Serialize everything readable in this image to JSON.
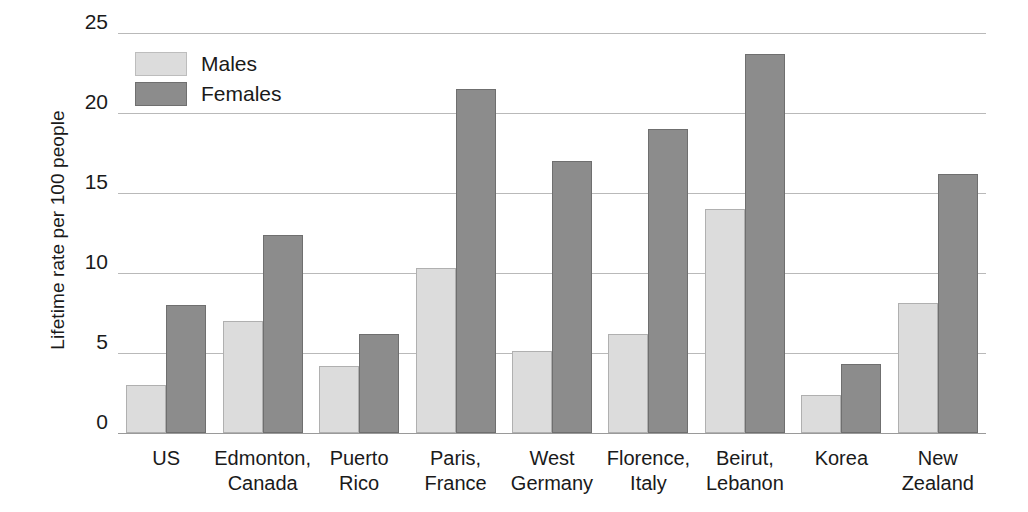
{
  "chart_data": {
    "type": "bar",
    "title": "",
    "subtitle": "",
    "xlabel": "",
    "ylabel": "Lifetime rate per 100 people",
    "ylim": [
      0,
      25
    ],
    "yticks": [
      0,
      5,
      10,
      15,
      20,
      25
    ],
    "ytick_labels": [
      "0",
      "5",
      "10",
      "15",
      "20",
      "25"
    ],
    "grid": true,
    "legend_position": "top-left inside plot",
    "categories": [
      "US",
      "Edmonton,\nCanada",
      "Puerto\nRico",
      "Paris,\nFrance",
      "West\nGermany",
      "Florence,\nItaly",
      "Beirut,\nLebanon",
      "Korea",
      "New\nZealand"
    ],
    "series": [
      {
        "name": "Males",
        "color": "#dcdcdc",
        "values": [
          3.0,
          7.0,
          4.2,
          10.3,
          5.1,
          6.2,
          14.0,
          2.4,
          8.1
        ]
      },
      {
        "name": "Females",
        "color": "#8c8c8c",
        "values": [
          8.0,
          12.4,
          6.2,
          21.5,
          17.0,
          19.0,
          23.7,
          4.3,
          16.2
        ]
      }
    ]
  },
  "legend": {
    "items": [
      {
        "label": "Males",
        "color": "#dcdcdc"
      },
      {
        "label": "Females",
        "color": "#8c8c8c"
      }
    ]
  },
  "colors": {
    "males": "#dcdcdc",
    "females": "#8c8c8c",
    "gridline": "#b9b9b9",
    "text": "#1a1a1a",
    "background": "#ffffff"
  }
}
